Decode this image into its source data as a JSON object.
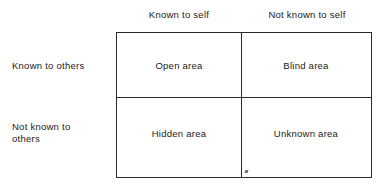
{
  "diagram": {
    "type": "johari-window",
    "kind": "2x2 matrix",
    "colors": {
      "line": "#2a2a2a",
      "text": "#1a1a1a",
      "background": "#ffffff"
    },
    "column_headers": [
      {
        "id": "known-to-self",
        "label": "Known to self"
      },
      {
        "id": "not-known-to-self",
        "label": "Not known to self"
      }
    ],
    "row_headers": [
      {
        "id": "known-to-others",
        "label": "Known to others"
      },
      {
        "id": "not-known-to-others",
        "line1": "Not known to",
        "line2": "others"
      }
    ],
    "quadrants": [
      {
        "id": "open-area",
        "label": "Open area",
        "row": "Known to others",
        "column": "Known to self"
      },
      {
        "id": "blind-area",
        "label": "Blind area",
        "row": "Known to others",
        "column": "Not known to self"
      },
      {
        "id": "hidden-area",
        "label": "Hidden area",
        "row": "Not known to others",
        "column": "Known to self"
      },
      {
        "id": "unknown-area",
        "label": "Unknown area",
        "row": "Not known to others",
        "column": "Not known to self"
      }
    ]
  }
}
